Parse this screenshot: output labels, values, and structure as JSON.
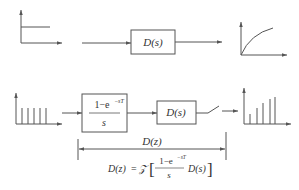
{
  "diagram": {
    "top_row": {
      "input_signal": "step",
      "block": {
        "label": "D(s)"
      },
      "output_signal": "continuous-response"
    },
    "bottom_row": {
      "input_signal": "sampled-step-impulses",
      "zoh_block": {
        "numerator": "1−e",
        "exponent": "−sT",
        "denominator": "s"
      },
      "block": {
        "label": "D(s)"
      },
      "switch": "sampler",
      "output_signal": "sampled-response"
    },
    "dimension": {
      "label": "D(z)"
    },
    "formula": {
      "lhs": "D(z)",
      "equals": "=",
      "operator": "𝒵",
      "open_bracket": "[",
      "numerator": "1−e",
      "exponent": "−sT",
      "denominator": "s",
      "factor": "D(s)",
      "close_bracket": "]"
    }
  },
  "colors": {
    "stroke": "#555555",
    "text": "#333333",
    "background": "#ffffff"
  }
}
